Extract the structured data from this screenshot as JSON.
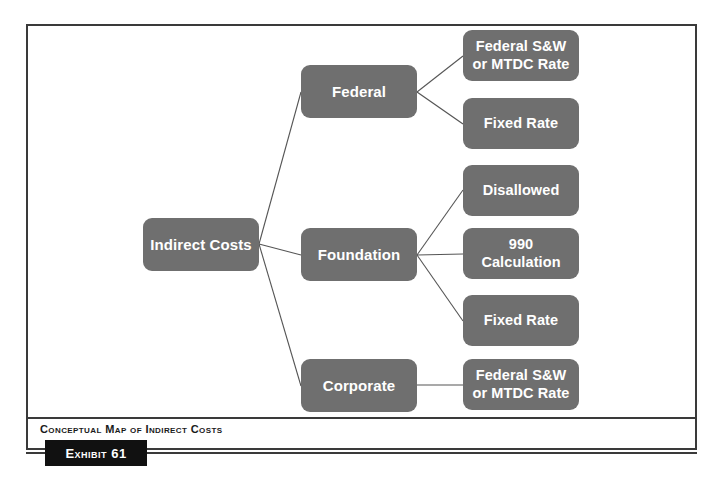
{
  "figure": {
    "caption": "Conceptual Map of Indirect Costs",
    "exhibit_label": "Exhibit 61",
    "colors": {
      "node_fill": "#6f6f6f",
      "node_text": "#ffffff",
      "frame_stroke": "#3a3a3a",
      "connector_stroke": "#555555",
      "exhibit_fill": "#111111",
      "page_background": "#ffffff"
    }
  },
  "diagram": {
    "type": "tree",
    "root": {
      "label": "Indirect Costs"
    },
    "branches": [
      {
        "label": "Federal",
        "children": [
          {
            "label": "Federal S&W\nor MTDC Rate",
            "line1": "Federal S&W",
            "line2": "or MTDC Rate"
          },
          {
            "label": "Fixed Rate",
            "line1": "Fixed Rate",
            "line2": ""
          }
        ]
      },
      {
        "label": "Foundation",
        "children": [
          {
            "label": "Disallowed",
            "line1": "Disallowed",
            "line2": ""
          },
          {
            "label": "990\nCalculation",
            "line1": "990",
            "line2": "Calculation"
          },
          {
            "label": "Fixed Rate",
            "line1": "Fixed Rate",
            "line2": ""
          }
        ]
      },
      {
        "label": "Corporate",
        "children": [
          {
            "label": "Federal S&W\nor MTDC Rate",
            "line1": "Federal S&W",
            "line2": "or MTDC Rate"
          }
        ]
      }
    ]
  }
}
